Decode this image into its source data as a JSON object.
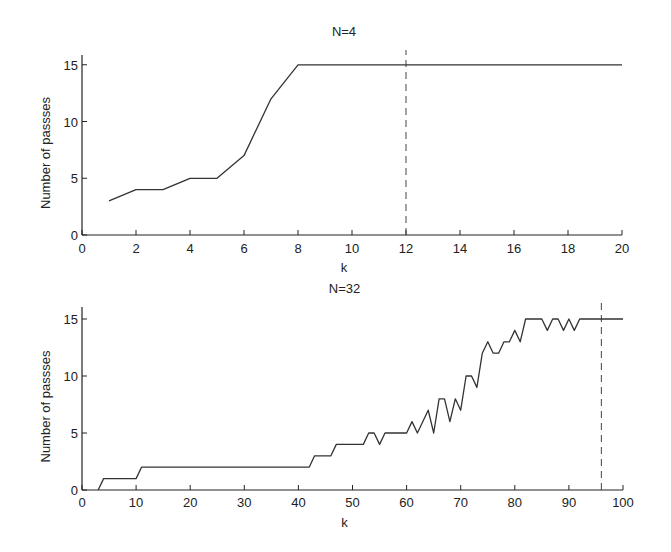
{
  "chart_data": [
    {
      "type": "line",
      "title": "N=4",
      "xlabel": "k",
      "ylabel": "Number of passses",
      "xlim": [
        0,
        20
      ],
      "ylim": [
        0,
        16
      ],
      "xticks": [
        0,
        2,
        4,
        6,
        8,
        10,
        12,
        14,
        16,
        18,
        20
      ],
      "yticks": [
        0,
        5,
        10,
        15
      ],
      "grid": false,
      "legend": null,
      "annotations": [
        {
          "type": "vertical-dashed-line",
          "x": 12
        }
      ],
      "series": [
        {
          "name": "passes",
          "x": [
            1,
            2,
            3,
            4,
            5,
            6,
            7,
            8,
            20
          ],
          "y": [
            3,
            4,
            4,
            5,
            5,
            7,
            12,
            15,
            15
          ]
        }
      ]
    },
    {
      "type": "line",
      "title": "N=32",
      "xlabel": "k",
      "ylabel": "Number of passses",
      "xlim": [
        0,
        100
      ],
      "ylim": [
        0,
        16
      ],
      "xticks": [
        0,
        10,
        20,
        30,
        40,
        50,
        60,
        70,
        80,
        90,
        100
      ],
      "yticks": [
        0,
        5,
        10,
        15
      ],
      "grid": false,
      "legend": null,
      "annotations": [
        {
          "type": "vertical-dashed-line",
          "x": 96
        }
      ],
      "series": [
        {
          "name": "passes",
          "x": [
            3,
            4,
            10,
            11,
            42,
            43,
            46,
            47,
            52,
            53,
            54,
            55,
            56,
            60,
            61,
            62,
            64,
            65,
            66,
            67,
            68,
            69,
            70,
            71,
            72,
            73,
            74,
            75,
            76,
            77,
            78,
            79,
            80,
            81,
            82,
            85,
            86,
            87,
            88,
            89,
            90,
            91,
            92,
            100
          ],
          "y": [
            0,
            1,
            1,
            2,
            2,
            3,
            3,
            4,
            4,
            5,
            5,
            4,
            5,
            5,
            6,
            5,
            7,
            5,
            8,
            8,
            6,
            8,
            7,
            10,
            10,
            9,
            12,
            13,
            12,
            12,
            13,
            13,
            14,
            13,
            15,
            15,
            14,
            15,
            15,
            14,
            15,
            14,
            15,
            15
          ]
        }
      ]
    }
  ],
  "layout": {
    "panels": [
      {
        "x0": 82,
        "x1": 622,
        "y0": 235,
        "yTop": 55,
        "yPerUnit": 11.35,
        "titleY": 36,
        "tickLabelY": 253,
        "xlabelY": 272
      },
      {
        "x0": 82,
        "x1": 623,
        "y0": 490,
        "yTop": 307,
        "yPerUnit": 11.4,
        "titleY": 293,
        "tickLabelY": 507,
        "xlabelY": 527
      }
    ]
  }
}
